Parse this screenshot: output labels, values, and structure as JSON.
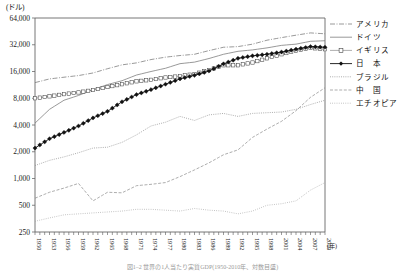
{
  "figure": {
    "y_unit_label": "(ドル)",
    "x_unit_label": "(年)",
    "caption": "図1‒2 世界の1人当たり実質GDP(1950-2010年、対数目盛)"
  },
  "axes": {
    "y_ticks": [
      "64,000",
      "32,000",
      "16,000",
      "8,000",
      "4,000",
      "2,000",
      "1,000",
      "500",
      "250"
    ],
    "y_tick_values": [
      64000,
      32000,
      16000,
      8000,
      4000,
      2000,
      1000,
      500,
      250
    ],
    "y_scale": "log2",
    "ylim": [
      250,
      64000
    ],
    "x_ticks": [
      "1950",
      "1953",
      "1956",
      "1959",
      "1962",
      "1965",
      "1968",
      "1971",
      "1974",
      "1977",
      "1980",
      "1983",
      "1986",
      "1989",
      "1992",
      "1995",
      "1998",
      "2001",
      "2004",
      "2007",
      "2010"
    ],
    "xlim": [
      1950,
      2010
    ],
    "x_minor_tick_interval": 1
  },
  "legend": {
    "position": "right",
    "items": [
      {
        "label": "アメリカ",
        "style": "dashdot",
        "marker": "none"
      },
      {
        "label": "ドイツ",
        "style": "solid",
        "marker": "none"
      },
      {
        "label": "イギリス",
        "style": "solid-thin",
        "marker": "open-square"
      },
      {
        "label": "日　本",
        "style": "solid-thin",
        "marker": "filled-diamond"
      },
      {
        "label": "ブラジル",
        "style": "dotted",
        "marker": "none"
      },
      {
        "label": "中　国",
        "style": "dashed",
        "marker": "none"
      },
      {
        "label": "エチオピア",
        "style": "fine-dotted",
        "marker": "none"
      }
    ]
  },
  "chart_data": {
    "type": "line",
    "title": "",
    "xlabel": "(年)",
    "ylabel": "(ドル)",
    "ylim": [
      250,
      64000
    ],
    "xlim": [
      1950,
      2010
    ],
    "yscale": "log",
    "grid": false,
    "legend_position": "right",
    "x": [
      1950,
      1953,
      1956,
      1959,
      1962,
      1965,
      1968,
      1971,
      1974,
      1977,
      1980,
      1983,
      1986,
      1989,
      1992,
      1995,
      1998,
      2001,
      2004,
      2007,
      2010
    ],
    "series": [
      {
        "name": "アメリカ",
        "style": "dashdot",
        "values": [
          12000,
          13200,
          13800,
          14400,
          15400,
          17200,
          19000,
          20000,
          21800,
          23200,
          24200,
          25000,
          27500,
          30000,
          30500,
          32500,
          36000,
          38500,
          41000,
          43500,
          42500
        ]
      },
      {
        "name": "ドイツ",
        "style": "solid",
        "values": [
          4200,
          6000,
          7600,
          8600,
          10000,
          11400,
          12600,
          14600,
          16000,
          17400,
          19600,
          20400,
          22400,
          25000,
          27000,
          28000,
          29500,
          31500,
          32500,
          35000,
          35500
        ]
      },
      {
        "name": "イギリス",
        "style": "open-square",
        "values": [
          8000,
          8400,
          8900,
          9300,
          9900,
          10700,
          11500,
          12400,
          12900,
          13700,
          14200,
          15000,
          16600,
          18800,
          18800,
          20200,
          22500,
          25000,
          27500,
          29500,
          28500
        ]
      },
      {
        "name": "日　本",
        "style": "filled-diamond",
        "values": [
          2200,
          2800,
          3300,
          3900,
          4800,
          5700,
          7300,
          8800,
          10000,
          11500,
          13200,
          14500,
          16200,
          19500,
          22500,
          24000,
          25000,
          26500,
          28500,
          30500,
          30000
        ]
      },
      {
        "name": "ブラジル",
        "style": "dotted",
        "values": [
          1400,
          1600,
          1750,
          1950,
          2200,
          2250,
          2550,
          3100,
          3900,
          4300,
          5000,
          4500,
          5200,
          5400,
          5000,
          5400,
          5500,
          5600,
          6000,
          6800,
          7600
        ]
      },
      {
        "name": "中　国",
        "style": "dashed",
        "values": [
          600,
          700,
          780,
          880,
          560,
          700,
          690,
          830,
          860,
          900,
          1050,
          1250,
          1500,
          1850,
          2100,
          2900,
          3600,
          4400,
          5800,
          8200,
          10500
        ]
      },
      {
        "name": "エチオピア",
        "style": "fine-dotted",
        "values": [
          330,
          360,
          390,
          400,
          410,
          420,
          430,
          450,
          450,
          440,
          430,
          460,
          440,
          430,
          400,
          430,
          500,
          520,
          560,
          740,
          900
        ]
      }
    ]
  }
}
